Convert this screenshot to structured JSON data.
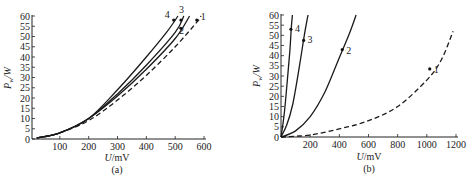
{
  "chart_data": [
    {
      "type": "line",
      "caption": "(a)",
      "xlabel": "U/mV",
      "ylabel": "P_w/W",
      "xlim": [
        0,
        600
      ],
      "ylim": [
        0,
        60
      ],
      "xticks": [
        100,
        200,
        300,
        400,
        500,
        600
      ],
      "yticks": [
        0,
        5,
        10,
        15,
        20,
        25,
        30,
        35,
        40,
        45,
        50,
        55,
        60
      ],
      "grid": false,
      "series": [
        {
          "name": "1",
          "style": "dashed",
          "x": [
            20,
            100,
            200,
            300,
            400,
            500,
            575,
            590
          ],
          "y": [
            0.5,
            3,
            9,
            19,
            31,
            45,
            57,
            60
          ],
          "marker_at": [
            575,
            58
          ]
        },
        {
          "name": "2",
          "style": "solid",
          "x": [
            20,
            100,
            200,
            300,
            400,
            500,
            550
          ],
          "y": [
            0.5,
            3,
            10,
            21,
            34,
            49,
            60
          ],
          "marker_at": [
            520,
            54
          ]
        },
        {
          "name": "3",
          "style": "solid",
          "x": [
            20,
            100,
            200,
            300,
            400,
            500,
            530
          ],
          "y": [
            0.5,
            3,
            10,
            22,
            36,
            52,
            60
          ],
          "marker_at": [
            520,
            58
          ]
        },
        {
          "name": "4",
          "style": "solid",
          "x": [
            20,
            100,
            200,
            300,
            400,
            470,
            510
          ],
          "y": [
            0.5,
            3,
            10,
            24,
            40,
            52,
            60
          ],
          "marker_at": [
            495,
            58
          ]
        }
      ]
    },
    {
      "type": "line",
      "caption": "(b)",
      "xlabel": "U/mV",
      "ylabel": "P_w/W",
      "xlim": [
        0,
        1200
      ],
      "ylim": [
        0,
        60
      ],
      "xticks": [
        200,
        400,
        600,
        800,
        1000,
        1200
      ],
      "yticks": [
        0,
        5,
        10,
        15,
        20,
        25,
        30,
        35,
        40,
        45,
        50,
        55,
        60
      ],
      "grid": false,
      "series": [
        {
          "name": "1",
          "style": "dashed",
          "x": [
            0,
            200,
            400,
            600,
            800,
            1000,
            1100,
            1180
          ],
          "y": [
            0,
            1,
            4,
            8,
            15,
            28,
            38,
            52
          ],
          "marker_at": [
            1020,
            33.5
          ]
        },
        {
          "name": "2",
          "style": "solid",
          "x": [
            0,
            100,
            200,
            300,
            400,
            470,
            515
          ],
          "y": [
            0,
            3,
            10,
            22,
            39,
            51,
            60
          ],
          "marker_at": [
            420,
            43
          ]
        },
        {
          "name": "3",
          "style": "solid",
          "x": [
            0,
            40,
            80,
            120,
            160,
            185
          ],
          "y": [
            0,
            6,
            16,
            32,
            50,
            60
          ],
          "marker_at": [
            155,
            47.5
          ]
        },
        {
          "name": "4",
          "style": "solid",
          "x": [
            0,
            20,
            40,
            60,
            70,
            78
          ],
          "y": [
            0,
            10,
            25,
            42,
            53,
            60
          ],
          "marker_at": [
            68,
            53
          ]
        }
      ]
    }
  ]
}
